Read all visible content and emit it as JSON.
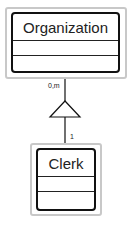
{
  "diagram": {
    "type": "UML class diagram (generalization)",
    "classes": [
      {
        "name": "Organization",
        "attributes": [],
        "operations": []
      },
      {
        "name": "Clerk",
        "attributes": [],
        "operations": []
      }
    ],
    "relationship": {
      "kind": "generalization",
      "from": "Clerk",
      "to": "Organization",
      "multiplicity_top": "0,m",
      "multiplicity_bottom": "1"
    }
  }
}
